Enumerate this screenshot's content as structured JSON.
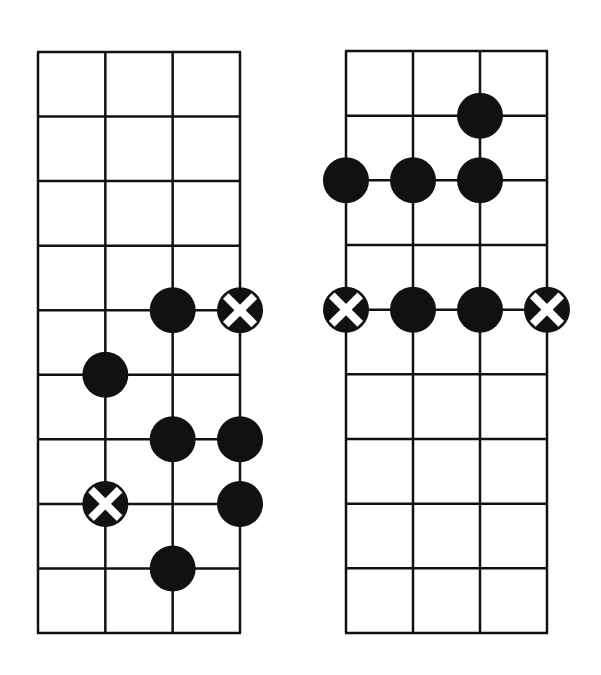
{
  "colors": {
    "background": "#ffffff",
    "line": "#111111",
    "dot": "#111111",
    "x_mark": "#ffffff"
  },
  "diagrams": [
    {
      "name": "left-fretboard",
      "origin": [
        38,
        52
      ],
      "width": 202,
      "height": 581,
      "strings": 4,
      "fret_lines": 10,
      "markers": [
        {
          "string": 2,
          "fret": 4,
          "type": "dot"
        },
        {
          "string": 3,
          "fret": 4,
          "type": "x"
        },
        {
          "string": 1,
          "fret": 5,
          "type": "dot"
        },
        {
          "string": 2,
          "fret": 6,
          "type": "dot"
        },
        {
          "string": 3,
          "fret": 6,
          "type": "dot"
        },
        {
          "string": 1,
          "fret": 7,
          "type": "x"
        },
        {
          "string": 3,
          "fret": 7,
          "type": "dot"
        },
        {
          "string": 2,
          "fret": 8,
          "type": "dot"
        }
      ]
    },
    {
      "name": "right-fretboard",
      "origin": [
        346,
        51
      ],
      "width": 201,
      "height": 582,
      "strings": 4,
      "fret_lines": 10,
      "markers": [
        {
          "string": 2,
          "fret": 1,
          "type": "dot"
        },
        {
          "string": 0,
          "fret": 2,
          "type": "dot"
        },
        {
          "string": 1,
          "fret": 2,
          "type": "dot"
        },
        {
          "string": 2,
          "fret": 2,
          "type": "dot"
        },
        {
          "string": 0,
          "fret": 4,
          "type": "x"
        },
        {
          "string": 1,
          "fret": 4,
          "type": "dot"
        },
        {
          "string": 2,
          "fret": 4,
          "type": "dot"
        },
        {
          "string": 3,
          "fret": 4,
          "type": "x"
        }
      ]
    }
  ],
  "marker_radius": 23
}
